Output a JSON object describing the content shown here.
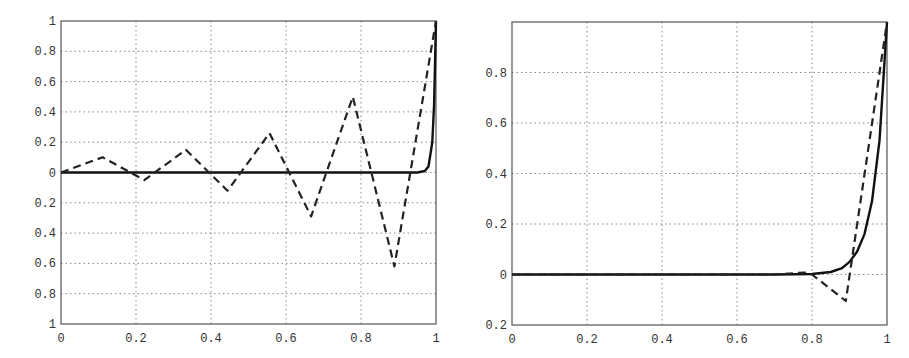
{
  "chart_data": [
    {
      "type": "line",
      "title": "",
      "xlabel": "",
      "ylabel": "",
      "xlim": [
        0,
        1
      ],
      "ylim": [
        -1,
        1
      ],
      "grid": true,
      "legend": null,
      "x_ticks": [
        "0",
        "0.2",
        "0.4",
        "0.6",
        "0.8",
        "1"
      ],
      "y_ticks": [
        "1",
        "0.8",
        "0.6",
        "0.4",
        "0.2",
        "0",
        "0.2",
        "0.4",
        "0.6",
        "0.8",
        "1"
      ],
      "y_tick_values": [
        1,
        0.8,
        0.6,
        0.4,
        0.2,
        0,
        -0.2,
        -0.4,
        -0.6,
        -0.8,
        -1
      ],
      "series": [
        {
          "name": "solid curve",
          "style": "solid",
          "x": [
            0,
            0.9,
            0.95,
            0.97,
            0.98,
            0.99,
            0.995,
            1.0
          ],
          "y": [
            0,
            0,
            0.0,
            0.01,
            0.04,
            0.2,
            0.45,
            1.0
          ]
        },
        {
          "name": "dashed curve",
          "style": "dashed",
          "x": [
            0,
            0.111,
            0.222,
            0.333,
            0.444,
            0.556,
            0.667,
            0.778,
            0.889,
            1.0
          ],
          "y": [
            0,
            0.1,
            -0.05,
            0.15,
            -0.12,
            0.26,
            -0.29,
            0.5,
            -0.62,
            1.0
          ]
        }
      ]
    },
    {
      "type": "line",
      "title": "",
      "xlabel": "",
      "ylabel": "",
      "xlim": [
        0,
        1
      ],
      "ylim": [
        -0.2,
        1
      ],
      "grid": true,
      "legend": null,
      "x_ticks": [
        "0",
        "0.2",
        "0.4",
        "0.6",
        "0.8",
        "1"
      ],
      "y_ticks": [
        "0.8",
        "0.6",
        "0.4",
        "0.2",
        "0",
        "0.2"
      ],
      "y_tick_values": [
        0.8,
        0.6,
        0.4,
        0.2,
        0,
        -0.2
      ],
      "series": [
        {
          "name": "solid curve",
          "style": "solid",
          "x": [
            0,
            0.7,
            0.8,
            0.85,
            0.88,
            0.9,
            0.92,
            0.94,
            0.96,
            0.98,
            1.0
          ],
          "y": [
            0,
            0,
            0.002,
            0.01,
            0.025,
            0.05,
            0.09,
            0.16,
            0.29,
            0.53,
            1.0
          ]
        },
        {
          "name": "dashed curve",
          "style": "dashed",
          "x": [
            0,
            0.7,
            0.78,
            0.8,
            0.89,
            1.0
          ],
          "y": [
            0,
            0,
            0.008,
            0,
            -0.105,
            1.0
          ]
        }
      ]
    }
  ]
}
